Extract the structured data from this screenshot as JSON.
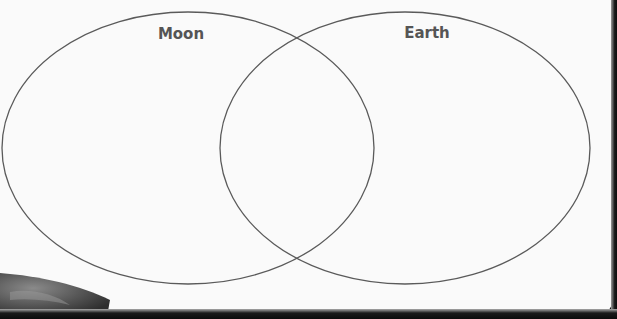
{
  "diagram": {
    "type": "venn",
    "sets": [
      {
        "label": "Moon",
        "shape": "ellipse",
        "cx": 188,
        "cy": 148,
        "rx": 186,
        "ry": 136,
        "label_x": 181,
        "label_y": 39
      },
      {
        "label": "Earth",
        "shape": "ellipse",
        "cx": 405,
        "cy": 148,
        "rx": 185,
        "ry": 136,
        "label_x": 427,
        "label_y": 38
      }
    ],
    "overlap_region": "both",
    "stroke_color": "#5a5a5a",
    "background_color": "#fafafa"
  },
  "decor": {
    "moon_texture_corner": "bottom-left"
  }
}
